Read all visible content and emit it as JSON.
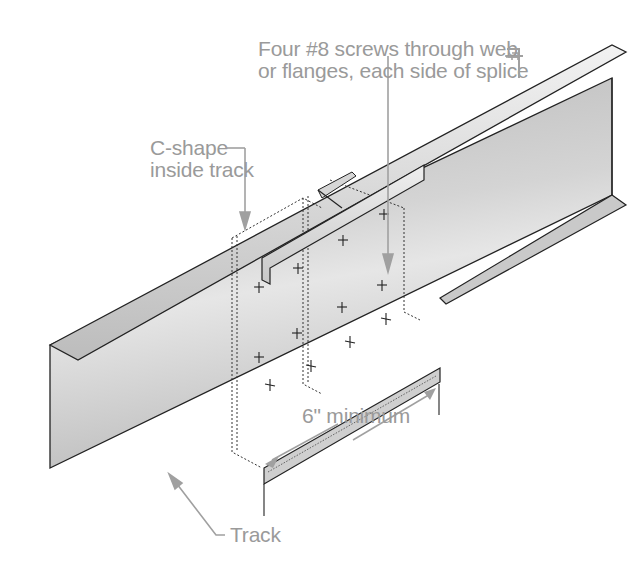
{
  "diagram": {
    "labels": {
      "screws_line1": "Four #8 screws through web",
      "screws_line2": "or flanges, each side of splice",
      "cshape_line1": "C-shape",
      "cshape_line2": "inside track",
      "dimension": "6\" minimum",
      "track": "Track"
    },
    "screw_marker": "+",
    "colors": {
      "label_text": "#9a9a9a",
      "leader_line": "#a0a0a0",
      "steel_light": "#e8e8e8",
      "steel_mid": "#c4c4c4",
      "steel_dark": "#9c9c9c",
      "outline": "#222222"
    }
  }
}
